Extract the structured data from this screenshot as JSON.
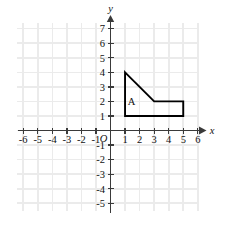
{
  "figure": {
    "type": "coordinate-plane",
    "origin_label": "O",
    "axis_labels": {
      "x": "x",
      "y": "y"
    }
  },
  "chart_data": {
    "type": "scatter",
    "title": "",
    "xlabel": "x",
    "ylabel": "y",
    "xlim": [
      -6.5,
      6.5
    ],
    "ylim": [
      -5.5,
      7.5
    ],
    "grid": true,
    "legend": "none",
    "x_ticks": [
      -6,
      -5,
      -4,
      -3,
      -2,
      -1,
      1,
      2,
      3,
      4,
      5,
      6
    ],
    "y_ticks": [
      -5,
      -4,
      -3,
      -2,
      -1,
      1,
      2,
      3,
      4,
      5,
      6,
      7
    ],
    "x_tick_labels": [
      "-6",
      "-5",
      "-4",
      "-3",
      "-2",
      "-1",
      "1",
      "2",
      "3",
      "4",
      "5",
      "6"
    ],
    "y_tick_labels": [
      "-5",
      "-4",
      "-3",
      "-2",
      "-1",
      "1",
      "2",
      "3",
      "4",
      "5",
      "6",
      "7"
    ],
    "origin_label": "O",
    "shapes": [
      {
        "name": "A",
        "label": "A",
        "label_position": [
          1.45,
          1.72
        ],
        "closed": true,
        "fill": "none",
        "stroke": "#000000",
        "vertices": [
          [
            1,
            4
          ],
          [
            3,
            2
          ],
          [
            5,
            2
          ],
          [
            5,
            1
          ],
          [
            1,
            1
          ]
        ]
      }
    ],
    "annotations": [
      {
        "text": "A",
        "x": 1.45,
        "y": 1.72
      }
    ]
  },
  "colors": {
    "grid": "#ebebeb",
    "axis": "#3a3a3a",
    "shape_stroke": "#000000",
    "text": "#111111",
    "background": "#ffffff"
  }
}
